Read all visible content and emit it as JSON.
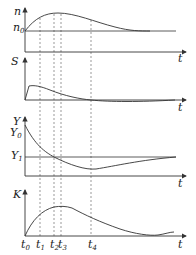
{
  "figure": {
    "panels": [
      {
        "id": "n",
        "ylabel": "n",
        "ref_label": "n",
        "ref_sub": "0",
        "xlabel": "t"
      },
      {
        "id": "S",
        "ylabel": "S",
        "xlabel": "t"
      },
      {
        "id": "Y",
        "ylabel": "Y",
        "ref0_label": "Y",
        "ref0_sub": "0",
        "ref1_label": "Y",
        "ref1_sub": "1",
        "xlabel": "t"
      },
      {
        "id": "K",
        "ylabel": "K",
        "xlabel": "t"
      }
    ],
    "time_marks": [
      {
        "label": "t",
        "sub": "0"
      },
      {
        "label": "t",
        "sub": "1"
      },
      {
        "label": "t",
        "sub": "2"
      },
      {
        "label": "t",
        "sub": "3"
      },
      {
        "label": "t",
        "sub": "4"
      }
    ]
  }
}
